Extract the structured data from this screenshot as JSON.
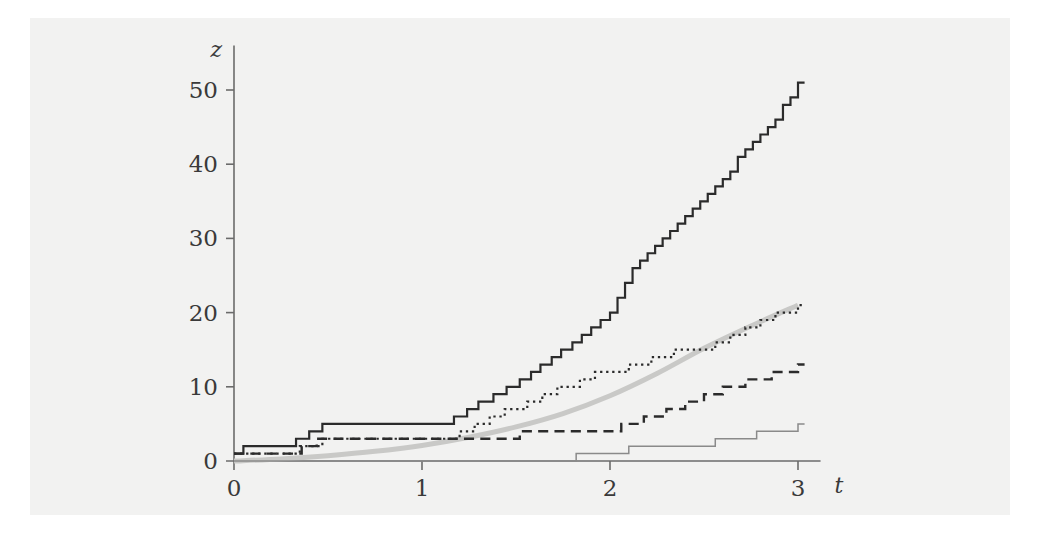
{
  "figure": {
    "background_color": "#ffffff",
    "panel_color": "#f2f2f1"
  },
  "chart_data": {
    "type": "line",
    "title": "",
    "subtitle": "",
    "xlabel": "t",
    "ylabel": "z",
    "xlim": [
      0,
      3.12
    ],
    "ylim": [
      0,
      56
    ],
    "xticks": [
      0,
      1,
      2,
      3
    ],
    "xticklabels": [
      "0",
      "1",
      "2",
      "3"
    ],
    "yticks": [
      0,
      10,
      20,
      30,
      40,
      50
    ],
    "yticklabels": [
      "0",
      "10",
      "20",
      "30",
      "40",
      "50"
    ],
    "grid": false,
    "legend": "none",
    "annotations": [],
    "series": [
      {
        "name": "sample-path-solid",
        "style": "solid",
        "color": "#2b2b2b",
        "width": 2.2,
        "kind": "step",
        "x": [
          0,
          0.05,
          0.33,
          0.4,
          0.47,
          1.17,
          1.24,
          1.3,
          1.38,
          1.45,
          1.52,
          1.58,
          1.63,
          1.69,
          1.74,
          1.8,
          1.85,
          1.9,
          1.95,
          2.0,
          2.04,
          2.08,
          2.12,
          2.16,
          2.2,
          2.24,
          2.28,
          2.32,
          2.36,
          2.4,
          2.44,
          2.48,
          2.52,
          2.56,
          2.6,
          2.64,
          2.68,
          2.72,
          2.76,
          2.8,
          2.84,
          2.88,
          2.92,
          2.96,
          3.0
        ],
        "y": [
          1,
          2,
          3,
          4,
          5,
          6,
          7,
          8,
          9,
          10,
          11,
          12,
          13,
          14,
          15,
          16,
          17,
          18,
          19,
          20,
          22,
          24,
          26,
          27,
          28,
          29,
          30,
          31,
          32,
          33,
          34,
          35,
          36,
          37,
          38,
          39,
          41,
          42,
          43,
          44,
          45,
          46,
          48,
          49,
          51
        ]
      },
      {
        "name": "sample-path-dotted",
        "style": "dotted",
        "color": "#2b2b2b",
        "width": 2.2,
        "kind": "step",
        "x": [
          0,
          0.35,
          0.47,
          1.2,
          1.28,
          1.36,
          1.44,
          1.56,
          1.64,
          1.72,
          1.84,
          1.92,
          2.0,
          2.1,
          2.22,
          2.34,
          2.46,
          2.56,
          2.64,
          2.72,
          2.8,
          2.88,
          2.94,
          3.0
        ],
        "y": [
          1,
          2,
          3,
          4,
          5,
          6,
          7,
          8,
          9,
          10,
          11,
          12,
          12,
          13,
          14,
          15,
          15,
          16,
          17,
          18,
          19,
          20,
          20,
          21
        ]
      },
      {
        "name": "sample-path-dashed",
        "style": "dashed",
        "color": "#2b2b2b",
        "width": 2.4,
        "kind": "step",
        "x": [
          0,
          0.36,
          0.44,
          1.34,
          1.52,
          1.9,
          2.06,
          2.18,
          2.3,
          2.4,
          2.5,
          2.6,
          2.72,
          2.86,
          3.0
        ],
        "y": [
          1,
          2,
          3,
          3,
          4,
          4,
          5,
          6,
          7,
          8,
          9,
          10,
          11,
          12,
          13
        ]
      },
      {
        "name": "sample-path-thin-gray",
        "style": "solid",
        "color": "#8a8a8a",
        "width": 1.5,
        "kind": "step",
        "x": [
          0,
          1.55,
          1.82,
          2.1,
          2.56,
          2.78,
          3.0
        ],
        "y": [
          0,
          0,
          1,
          2,
          3,
          4,
          5
        ]
      },
      {
        "name": "mean-curve-exponential",
        "style": "smooth",
        "color": "#c9c9c7",
        "width": 5,
        "kind": "curve",
        "formula": "z = exp(a*t) - 1",
        "x": [
          0,
          0.25,
          0.5,
          0.75,
          1.0,
          1.25,
          1.5,
          1.75,
          2.0,
          2.25,
          2.5,
          2.75,
          3.0
        ],
        "y": [
          0,
          0.28,
          0.72,
          1.3,
          2.1,
          3.2,
          4.6,
          6.4,
          8.8,
          11.8,
          15.2,
          18.2,
          21.0
        ]
      }
    ]
  }
}
